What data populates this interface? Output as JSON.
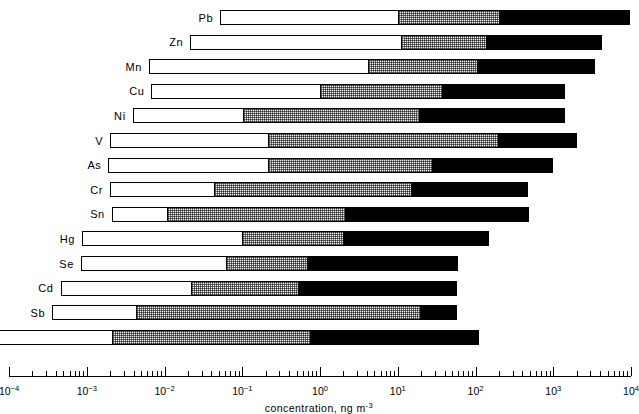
{
  "chart_data": {
    "type": "bar",
    "title": "",
    "subtitle": "",
    "xlabel": "concentration, ng m-3",
    "xlabel_base": "concentration, ng m",
    "xlabel_exponent": "-3",
    "ylabel": "",
    "scale": "log",
    "xlim": [
      0.0001,
      10000
    ],
    "grid": false,
    "legend_position": "none",
    "orientation": "horizontal",
    "segment_names": [
      "open",
      "stippled",
      "solid"
    ],
    "axis": {
      "decade_exponents": [
        -4,
        -3,
        -2,
        -1,
        0,
        1,
        2,
        3,
        4
      ],
      "tick_labels": [
        "10-4",
        "10-3",
        "10-2",
        "10-1",
        "100",
        "101",
        "102",
        "103",
        "104"
      ],
      "minor_ticks_per_decade": [
        2,
        3,
        4,
        5,
        6,
        7,
        8,
        9
      ]
    },
    "categories": [
      "Pb",
      "Zn",
      "Mn",
      "Cu",
      "Ni",
      "V",
      "As",
      "Cr",
      "Sn",
      "Hg",
      "Se",
      "Cd",
      "Sb",
      "Co"
    ],
    "bars": [
      {
        "label": "Pb",
        "start": 0.052,
        "b1": 10.0,
        "b2": 200.0,
        "end": 9800.0
      },
      {
        "label": "Zn",
        "start": 0.0215,
        "b1": 11.0,
        "b2": 140.0,
        "end": 4200.0
      },
      {
        "label": "Mn",
        "start": 0.0063,
        "b1": 4.2,
        "b2": 105.0,
        "end": 3400.0
      },
      {
        "label": "Cu",
        "start": 0.0068,
        "b1": 1.0,
        "b2": 37.0,
        "end": 1400.0
      },
      {
        "label": "Ni",
        "start": 0.0039,
        "b1": 0.1,
        "b2": 19.0,
        "end": 1400.0
      },
      {
        "label": "V",
        "start": 0.002,
        "b1": 0.21,
        "b2": 200.0,
        "end": 2000.0
      },
      {
        "label": "As",
        "start": 0.0019,
        "b1": 0.21,
        "b2": 28.0,
        "end": 1000.0
      },
      {
        "label": "Cr",
        "start": 0.002,
        "b1": 0.043,
        "b2": 15.0,
        "end": 480.0
      },
      {
        "label": "Sn",
        "start": 0.0021,
        "b1": 0.0105,
        "b2": 2.1,
        "end": 490.0
      },
      {
        "label": "Hg",
        "start": 0.00087,
        "b1": 0.1,
        "b2": 2.0,
        "end": 150.0
      },
      {
        "label": "Se",
        "start": 0.00084,
        "b1": 0.062,
        "b2": 0.68,
        "end": 60.0
      },
      {
        "label": "Cd",
        "start": 0.00046,
        "b1": 0.022,
        "b2": 0.52,
        "end": 58.0
      },
      {
        "label": "Sb",
        "start": 0.00036,
        "b1": 0.0042,
        "b2": 20.0,
        "end": 58.0
      },
      {
        "label": "Co",
        "start": 5.5e-05,
        "b1": 0.0021,
        "b2": 0.74,
        "end": 110.0
      }
    ]
  },
  "colors": {
    "open": "#ffffff",
    "stippled": "#f2f2f2",
    "solid": "#000000",
    "outline": "#000000",
    "background": "#ffffff"
  }
}
